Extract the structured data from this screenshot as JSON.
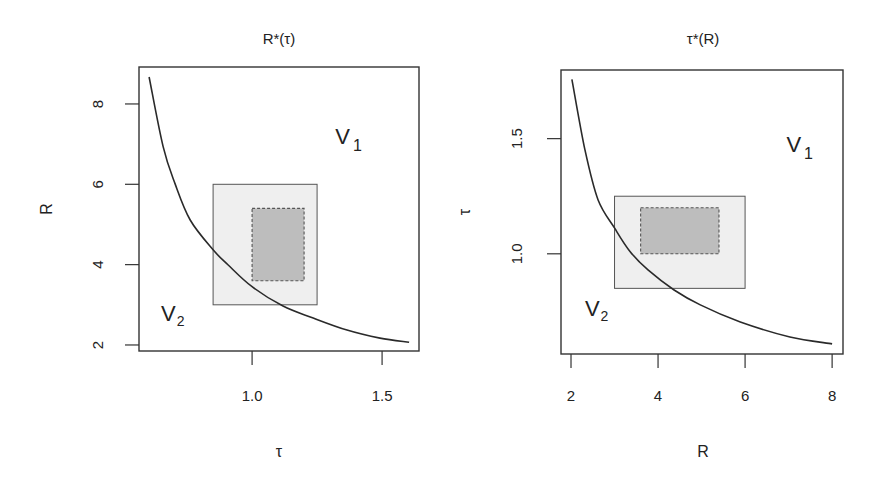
{
  "chart_data": [
    {
      "type": "line",
      "title": "R*(τ)",
      "xlabel": "τ",
      "ylabel": "R",
      "xlim": [
        0.565,
        1.642
      ],
      "ylim": [
        1.85,
        8.92
      ],
      "xticks": [
        1.0,
        1.5
      ],
      "xtick_labels": [
        "1.0",
        "1.5"
      ],
      "yticks": [
        2,
        4,
        6,
        8
      ],
      "ytick_labels": [
        "2",
        "4",
        "6",
        "8"
      ],
      "grid": false,
      "legend": null,
      "series": [
        {
          "name": "R*(τ)",
          "x": [
            0.604,
            0.658,
            0.704,
            0.762,
            0.85,
            0.908,
            1.0,
            1.119,
            1.235,
            1.365,
            1.492,
            1.604
          ],
          "y": [
            8.67,
            6.93,
            6.01,
            5.11,
            4.37,
            3.99,
            3.45,
            2.97,
            2.67,
            2.37,
            2.17,
            2.07
          ]
        }
      ],
      "rectangles": [
        {
          "name": "outer-region",
          "x0": 0.85,
          "x1": 1.25,
          "y0": 3.0,
          "y1": 6.0,
          "fill": "#efefef",
          "stroke": "#555555",
          "dashed": false
        },
        {
          "name": "inner-region",
          "x0": 1.0,
          "x1": 1.2,
          "y0": 3.6,
          "y1": 5.4,
          "fill": "#bdbdbd",
          "stroke": "#555555",
          "dashed": true
        }
      ],
      "annotations": [
        {
          "name": "V1",
          "text": "V",
          "sub": "1",
          "x": 1.32,
          "y": 7.0,
          "size": "large"
        },
        {
          "name": "V2",
          "text": "V",
          "sub": "2",
          "x": 0.65,
          "y": 2.6,
          "size": "medium"
        }
      ],
      "frame_px": {
        "left": 139,
        "top": 67,
        "right": 419,
        "bottom": 351
      },
      "title_px": {
        "x": 279,
        "y": 44
      },
      "xlabel_px": {
        "x": 279,
        "y": 457
      },
      "ylabel_px": {
        "x": 52,
        "y": 209
      },
      "ytick_label_x": 103,
      "xtick_label_y": 401
    },
    {
      "type": "line",
      "title": "τ*(R)",
      "xlabel": "R",
      "ylabel": "τ",
      "xlim": [
        1.77,
        8.25
      ],
      "ylim": [
        0.565,
        1.798
      ],
      "xticks": [
        2,
        4,
        6,
        8
      ],
      "xtick_labels": [
        "2",
        "4",
        "6",
        "8"
      ],
      "yticks": [
        1.0,
        1.5
      ],
      "ytick_labels": [
        "1.0",
        "1.5"
      ],
      "grid": false,
      "legend": null,
      "series": [
        {
          "name": "τ*(R)",
          "x": [
            2.02,
            2.32,
            2.62,
            3.01,
            3.36,
            3.77,
            4.37,
            4.97,
            5.89,
            7.03,
            8.0
          ],
          "y": [
            1.757,
            1.452,
            1.235,
            1.109,
            1.009,
            0.93,
            0.843,
            0.778,
            0.704,
            0.639,
            0.609
          ]
        }
      ],
      "rectangles": [
        {
          "name": "outer-region",
          "x0": 3.0,
          "x1": 6.0,
          "y0": 0.85,
          "y1": 1.25,
          "fill": "#efefef",
          "stroke": "#555555",
          "dashed": false
        },
        {
          "name": "inner-region",
          "x0": 3.6,
          "x1": 5.4,
          "y0": 1.0,
          "y1": 1.2,
          "fill": "#bdbdbd",
          "stroke": "#555555",
          "dashed": true
        }
      ],
      "annotations": [
        {
          "name": "V1",
          "text": "V",
          "sub": "1",
          "x": 6.95,
          "y": 1.44,
          "size": "large"
        },
        {
          "name": "V2",
          "text": "V",
          "sub": "2",
          "x": 2.32,
          "y": 0.73,
          "size": "medium"
        }
      ],
      "frame_px": {
        "left": 561,
        "top": 70,
        "right": 843,
        "bottom": 354
      },
      "title_px": {
        "x": 703,
        "y": 44
      },
      "xlabel_px": {
        "x": 703,
        "y": 457
      },
      "ylabel_px": {
        "x": 470,
        "y": 212
      },
      "ytick_label_x": 522,
      "xtick_label_y": 401
    }
  ]
}
